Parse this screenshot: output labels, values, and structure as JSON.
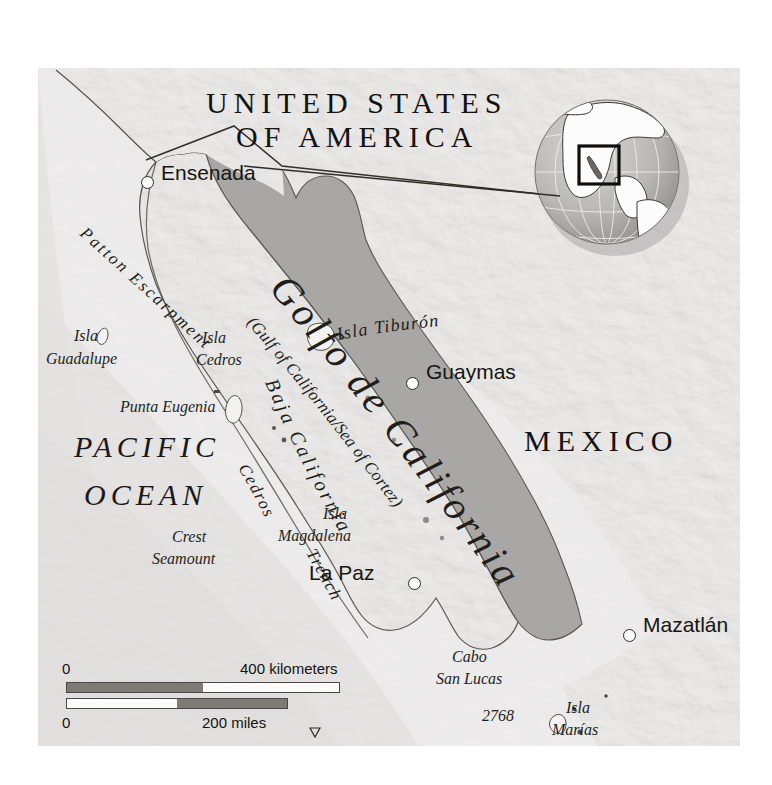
{
  "map": {
    "title_primary": "UNITED STATES",
    "title_secondary": "OF AMERICA",
    "country_mexico": "MEXICO",
    "ocean_line1": "PACIFIC",
    "ocean_line2": "OCEAN",
    "gulf_name_es": "Golfo de California",
    "gulf_name_en": "(Gulf of California/Sea of Cortez)",
    "peninsula": "Baja California",
    "background_color": "#eceaea",
    "water_color": "#a9a7a6",
    "land_color": "#e2e0df",
    "coast_color": "#57544f"
  },
  "cities": [
    {
      "name": "Ensenada",
      "x": 147,
      "y": 182,
      "label_dx": 14,
      "label_dy": -21
    },
    {
      "name": "Guaymas",
      "x": 412,
      "y": 383,
      "label_dx": 14,
      "label_dy": -23
    },
    {
      "name": "La Paz",
      "x": 414,
      "y": 583,
      "label_dx": -105,
      "label_dy": -22
    },
    {
      "name": "Mazatlán",
      "x": 629,
      "y": 635,
      "label_dx": 14,
      "label_dy": -22
    }
  ],
  "features": [
    {
      "name": "Patton Escarpment",
      "kind": "undersea-ridge"
    },
    {
      "name": "Isla Guadalupe",
      "kind": "island"
    },
    {
      "name": "Isla Cedros",
      "kind": "island"
    },
    {
      "name": "Punta Eugenia",
      "kind": "cape"
    },
    {
      "name": "Isla Tiburón",
      "kind": "island"
    },
    {
      "name": "Crest Seamount",
      "kind": "seamount"
    },
    {
      "name": "Cedros Trench",
      "kind": "trench"
    },
    {
      "name": "Isla Magdalena",
      "kind": "island"
    },
    {
      "name": "Cabo San Lucas",
      "kind": "cape"
    },
    {
      "name": "Isla Marías",
      "kind": "island"
    },
    {
      "name": "2768",
      "kind": "depth-sounding"
    }
  ],
  "feature_labels": {
    "patton": "Patton Escarpment",
    "guadalupe_l1": "Isla",
    "guadalupe_l2": "Guadalupe",
    "cedros_l1": "Isla",
    "cedros_l2": "Cedros",
    "punta_eugenia": "Punta Eugenia",
    "tiburon": "Isla Tiburón",
    "crest_l1": "Crest",
    "crest_l2": "Seamount",
    "cedros_trench_a": "Cedros",
    "cedros_trench_b": "Trench",
    "magdalena_l1": "Isla",
    "magdalena_l2": "Magdalena",
    "cabo_l1": "Cabo",
    "cabo_l2": "San Lucas",
    "marias_l1": "Isla",
    "marias_l2": "Marías",
    "depth": "2768"
  },
  "scale": {
    "km_zero": "0",
    "km_label": "400 kilometers",
    "mi_zero": "0",
    "mi_label": "200 miles"
  },
  "globe": {
    "name": "locator-globe",
    "highlight_region": "Baja California"
  }
}
